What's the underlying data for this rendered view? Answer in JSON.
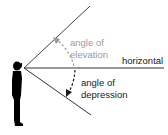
{
  "diagram": {
    "labels": {
      "elevation_line1": "angle of",
      "elevation_line2": "elevation",
      "horizontal": "horizontal",
      "depression_line1": "angle of",
      "depression_line2": "depression"
    },
    "colors": {
      "elevation": "#9a9a9a",
      "depression": "#1a1a1a",
      "lines": "#333333",
      "figure": "#000000"
    }
  }
}
